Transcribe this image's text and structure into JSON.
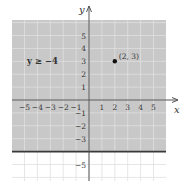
{
  "chart_data": {
    "type": "scatter",
    "title": "",
    "xlabel": "x",
    "ylabel": "y",
    "xlim": [
      -6,
      6
    ],
    "ylim": [
      -6,
      6
    ],
    "grid": true,
    "x_ticks": [
      "−5",
      "−4",
      "−3",
      "−2",
      "−1",
      "1",
      "2",
      "3",
      "4",
      "5"
    ],
    "y_ticks": [
      "5",
      "4",
      "3",
      "2",
      "1",
      "−1",
      "−2",
      "−3",
      "−5"
    ],
    "shaded_region": {
      "inequality": "y ≥ −4",
      "boundary_y": -4,
      "boundary_style": "solid"
    },
    "points": [
      {
        "x": 2,
        "y": 3,
        "label": "(2, 3)"
      }
    ],
    "annotations": [
      {
        "text": "y ≥ −4",
        "x": -4,
        "y": 3
      }
    ]
  },
  "labels": {
    "inequality": "y ≥ −4",
    "point": "(2, 3)",
    "x_axis": "x",
    "y_axis": "y"
  },
  "colors": {
    "shade": "#c8c8c8",
    "grid_shaded": "#e0e0e0",
    "grid_unshaded": "#dcdcdc",
    "axis": "#555555",
    "boundary": "#3a3a3a",
    "point": "#111111"
  }
}
